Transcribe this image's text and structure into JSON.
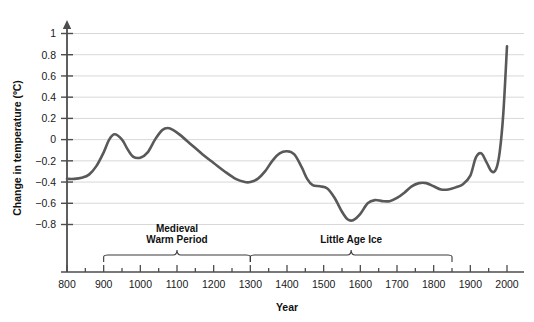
{
  "chart_data": {
    "type": "line",
    "title": "",
    "xlabel": "Year",
    "ylabel": "Change in temperature (ºC)",
    "xlim": [
      800,
      2000
    ],
    "ylim": [
      -0.95,
      1.1
    ],
    "xticks": [
      800,
      900,
      1000,
      1100,
      1200,
      1300,
      1400,
      1500,
      1600,
      1700,
      1800,
      1900,
      2000
    ],
    "xtick_labels": [
      "800",
      "900",
      "1000",
      "1100",
      "1200",
      "1300",
      "1400",
      "1500",
      "1600",
      "1700",
      "1800",
      "1900",
      "2000"
    ],
    "xtick_minor_step": 50,
    "yticks": [
      1,
      0.8,
      0.6,
      0.4,
      0.2,
      0,
      -0.2,
      -0.4,
      -0.6,
      -0.8
    ],
    "ytick_labels": [
      "1",
      "0.8",
      "0.6",
      "0.4",
      "0.2",
      "0",
      "−0.2",
      "−0.4",
      "−0.6",
      "−0.8"
    ],
    "grid": true,
    "grid_color": "#d8d8d8",
    "legend": "none",
    "line_color": "#595959",
    "line_width": 2.6,
    "axis_color": "#4d4d4d",
    "series": [
      {
        "name": "Northern Hemisphere temperature anomaly",
        "x": [
          800,
          820,
          840,
          860,
          880,
          900,
          915,
          930,
          950,
          965,
          980,
          1000,
          1020,
          1040,
          1060,
          1075,
          1090,
          1110,
          1140,
          1170,
          1200,
          1230,
          1260,
          1285,
          1300,
          1320,
          1340,
          1360,
          1380,
          1400,
          1420,
          1440,
          1455,
          1470,
          1490,
          1510,
          1530,
          1550,
          1565,
          1580,
          1600,
          1620,
          1640,
          1660,
          1680,
          1700,
          1720,
          1740,
          1760,
          1780,
          1800,
          1820,
          1840,
          1860,
          1880,
          1900,
          1915,
          1930,
          1945,
          1958,
          1970,
          1980,
          1990,
          2000
        ],
        "y": [
          -0.37,
          -0.37,
          -0.36,
          -0.33,
          -0.25,
          -0.12,
          0.0,
          0.05,
          0.0,
          -0.09,
          -0.16,
          -0.17,
          -0.12,
          0.0,
          0.09,
          0.11,
          0.09,
          0.04,
          -0.05,
          -0.14,
          -0.22,
          -0.3,
          -0.37,
          -0.4,
          -0.4,
          -0.37,
          -0.3,
          -0.2,
          -0.13,
          -0.11,
          -0.14,
          -0.26,
          -0.37,
          -0.43,
          -0.44,
          -0.46,
          -0.55,
          -0.68,
          -0.75,
          -0.76,
          -0.7,
          -0.6,
          -0.57,
          -0.58,
          -0.58,
          -0.55,
          -0.5,
          -0.44,
          -0.41,
          -0.41,
          -0.44,
          -0.47,
          -0.47,
          -0.45,
          -0.42,
          -0.34,
          -0.17,
          -0.13,
          -0.22,
          -0.3,
          -0.28,
          -0.12,
          0.25,
          0.88
        ]
      }
    ],
    "annotations": [
      {
        "name": "medieval-warm-period",
        "label_lines": [
          "Medieval",
          "Warm Period"
        ],
        "bracket_start": 900,
        "bracket_end": 1300
      },
      {
        "name": "little-ice-age",
        "label_lines": [
          "Little Age Ice"
        ],
        "bracket_start": 1300,
        "bracket_end": 1850
      }
    ]
  }
}
